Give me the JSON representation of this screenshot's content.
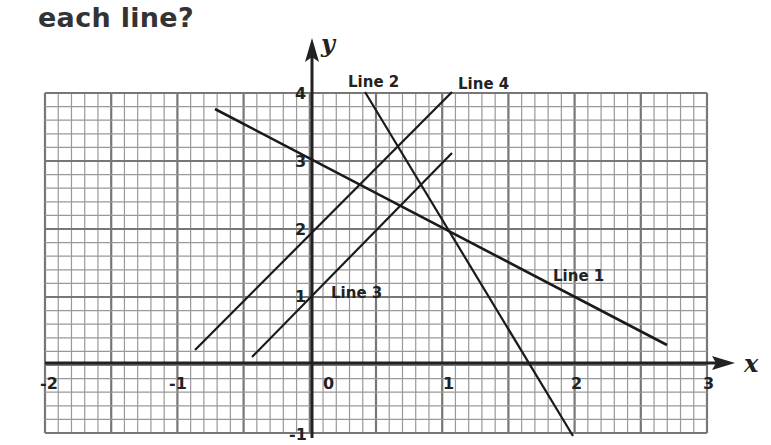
{
  "question": {
    "text": "each line?"
  },
  "chart_data": {
    "type": "line",
    "title": "",
    "xlabel": "x",
    "ylabel": "y",
    "xlim": [
      -2,
      3
    ],
    "ylim": [
      -1,
      4
    ],
    "grid": true,
    "x_ticks": [
      "-2",
      "-1",
      "0",
      "1",
      "2",
      "3"
    ],
    "y_ticks": [
      "4",
      "3",
      "2",
      "1",
      "-1"
    ],
    "series": [
      {
        "name": "Line 1",
        "equation": "y = -x + 3",
        "x": [
          -0.74,
          2.7
        ],
        "y": [
          3.74,
          0.3
        ]
      },
      {
        "name": "Line 2",
        "equation": "y = -3x + 5",
        "x": [
          0.33,
          1.98
        ],
        "y": [
          4,
          -1
        ]
      },
      {
        "name": "Line 3",
        "equation": "y = 2x + 1",
        "x": [
          -0.45,
          1.05
        ],
        "y": [
          0.1,
          3.1
        ]
      },
      {
        "name": "Line 4",
        "equation": "y = 2x + 2",
        "x": [
          -0.9,
          1.05
        ],
        "y": [
          0.2,
          4.0
        ]
      }
    ],
    "annotations": [
      "Line 1",
      "Line 2",
      "Line 3",
      "Line 4"
    ]
  },
  "labels": {
    "line1": "Line 1",
    "line2": "Line 2",
    "line3": "Line 3",
    "line4": "Line 4",
    "x_axis": "x",
    "y_axis": "y",
    "xt_m2": "-2",
    "xt_m1": "-1",
    "xt_0": "0",
    "xt_1": "1",
    "xt_2": "2",
    "xt_3": "3",
    "yt_4": "4",
    "yt_3": "3",
    "yt_2": "2",
    "yt_1": "1",
    "yt_m1": "-1"
  }
}
